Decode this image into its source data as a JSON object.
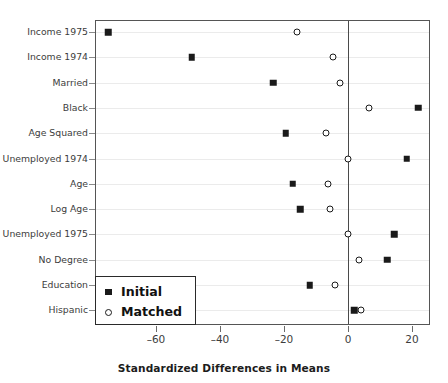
{
  "chart_data": {
    "type": "scatter",
    "title": "",
    "xlabel": "Standardized Differences in Means",
    "ylabel": "",
    "xlim": [
      -78.5,
      25.5
    ],
    "xticks": [
      -60,
      -40,
      -20,
      0,
      20
    ],
    "xticklabels": [
      "–60",
      "–40",
      "–20",
      "0",
      "20"
    ],
    "grid": "horizontal",
    "reference_line_x": 0,
    "legend_position": "bottom-left",
    "categories": [
      "Income 1975",
      "Income 1974",
      "Married",
      "Black",
      "Age Squared",
      "Unemployed 1974",
      "Age",
      "Log Age",
      "Unemployed 1975",
      "No Degree",
      "Education",
      "Hispanic"
    ],
    "series": [
      {
        "name": "Initial",
        "marker": "filled-square",
        "color": "#1a1a1a",
        "values": [
          -75.0,
          -48.8,
          -23.4,
          21.9,
          -19.4,
          18.4,
          -17.2,
          -15.0,
          14.4,
          12.2,
          -11.9,
          1.9
        ]
      },
      {
        "name": "Matched",
        "marker": "open-circle",
        "color": "#1a1a1a",
        "values": [
          -16.0,
          -4.7,
          -2.5,
          6.6,
          -6.9,
          0.0,
          -6.2,
          -5.6,
          0.0,
          3.4,
          -4.1,
          4.1
        ]
      }
    ],
    "legend": [
      {
        "label": "Initial",
        "marker": "filled-square"
      },
      {
        "label": "Matched",
        "marker": "open-circle"
      }
    ]
  }
}
